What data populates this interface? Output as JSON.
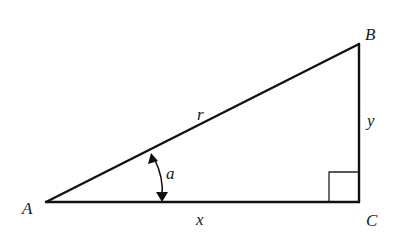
{
  "figure": {
    "type": "right-triangle",
    "background": "#ffffff",
    "stroke_color": "#111111",
    "vertices": [
      {
        "id": "A",
        "label": "A",
        "x": 46,
        "y": 202
      },
      {
        "id": "B",
        "label": "B",
        "x": 359,
        "y": 44
      },
      {
        "id": "C",
        "label": "C",
        "x": 359,
        "y": 202
      }
    ],
    "sides": {
      "hypotenuse": {
        "from": "A",
        "to": "B",
        "label": "r"
      },
      "opposite": {
        "from": "B",
        "to": "C",
        "label": "y"
      },
      "adjacent": {
        "from": "A",
        "to": "C",
        "label": "x"
      }
    },
    "angle": {
      "vertex": "A",
      "label": "a",
      "marker": "double-arrow-arc"
    },
    "right_angle": {
      "vertex": "C",
      "marker": "square"
    }
  },
  "labels": {
    "A": "A",
    "B": "B",
    "C": "C",
    "r": "r",
    "x": "x",
    "y": "y",
    "a": "a"
  }
}
